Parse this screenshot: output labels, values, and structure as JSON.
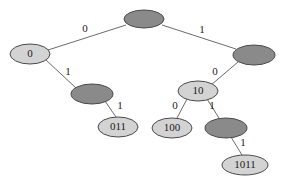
{
  "diagram": {
    "type": "binary-trie",
    "title": "",
    "colors": {
      "node_light_fill": "#d3d3d3",
      "node_dark_fill": "#8a8a8a",
      "node_stroke": "#4a4a4a",
      "edge_stroke": "#6b6b6b",
      "label_text": "#1a1a1a",
      "background": "#ffffff"
    },
    "nodes": [
      {
        "id": "root",
        "label": "",
        "style": "dark",
        "cx": 144,
        "cy": 19,
        "rx": 20,
        "ry": 9
      },
      {
        "id": "n0",
        "label": "0",
        "style": "light",
        "cx": 30,
        "cy": 54,
        "rx": 20,
        "ry": 10
      },
      {
        "id": "n1",
        "label": "",
        "style": "dark",
        "cx": 254,
        "cy": 55,
        "rx": 21,
        "ry": 10
      },
      {
        "id": "n01",
        "label": "",
        "style": "dark",
        "cx": 92,
        "cy": 94,
        "rx": 21,
        "ry": 10
      },
      {
        "id": "n10",
        "label": "10",
        "style": "light",
        "cx": 198,
        "cy": 91,
        "rx": 20,
        "ry": 10
      },
      {
        "id": "n011",
        "label": "011",
        "style": "light",
        "cx": 118,
        "cy": 127,
        "rx": 20,
        "ry": 10
      },
      {
        "id": "n100",
        "label": "100",
        "style": "light",
        "cx": 172,
        "cy": 128,
        "rx": 20,
        "ry": 10
      },
      {
        "id": "n101",
        "label": "",
        "style": "dark",
        "cx": 226,
        "cy": 128,
        "rx": 21,
        "ry": 10
      },
      {
        "id": "n1011",
        "label": "1011",
        "style": "light",
        "cx": 245,
        "cy": 165,
        "rx": 23,
        "ry": 10
      }
    ],
    "edges": [
      {
        "from": "root",
        "to": "n0",
        "label": "0",
        "x1": 126,
        "y1": 25,
        "x2": 48,
        "y2": 50,
        "lx": 85,
        "ly": 29
      },
      {
        "from": "root",
        "to": "n1",
        "label": "1",
        "x1": 162,
        "y1": 25,
        "x2": 236,
        "y2": 49,
        "lx": 202,
        "ly": 30
      },
      {
        "from": "n0",
        "to": "n01",
        "label": "1",
        "x1": 46,
        "y1": 60,
        "x2": 76,
        "y2": 88,
        "lx": 68,
        "ly": 72
      },
      {
        "from": "n1",
        "to": "n10",
        "label": "0",
        "x1": 238,
        "y1": 62,
        "x2": 211,
        "y2": 85,
        "lx": 215,
        "ly": 72
      },
      {
        "from": "n01",
        "to": "n011",
        "label": "1",
        "x1": 105,
        "y1": 101,
        "x2": 116,
        "y2": 117,
        "lx": 120,
        "ly": 106
      },
      {
        "from": "n10",
        "to": "n100",
        "label": "0",
        "x1": 187,
        "y1": 99,
        "x2": 177,
        "y2": 118,
        "lx": 175,
        "ly": 106
      },
      {
        "from": "n10",
        "to": "n101",
        "label": "1",
        "x1": 207,
        "y1": 99,
        "x2": 219,
        "y2": 118,
        "lx": 212,
        "ly": 106
      },
      {
        "from": "n101",
        "to": "n1011",
        "label": "1",
        "x1": 231,
        "y1": 137,
        "x2": 242,
        "y2": 155,
        "lx": 243,
        "ly": 143
      }
    ]
  }
}
